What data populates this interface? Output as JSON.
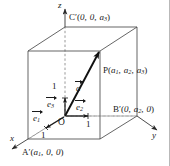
{
  "figure": {
    "kind": "3d-coordinate-box-vector-diagram",
    "width": 170,
    "height": 166,
    "background_color": "#ffffff",
    "line_color": "#4a4a4a",
    "bold_line_color": "#111111",
    "text_color": "#1a1a1a",
    "border_color": "#b9b9b9"
  },
  "axes": {
    "x": {
      "label": "x"
    },
    "y": {
      "label": "y"
    },
    "z": {
      "label": "z"
    }
  },
  "origin": {
    "label": "O"
  },
  "points": {
    "P": {
      "name": "P",
      "prime": "",
      "coords": "(a1, a2, a3)",
      "c1": "a",
      "c1sub": "1",
      "c2": "a",
      "c2sub": "2",
      "c3": "a",
      "c3sub": "3"
    },
    "Ap": {
      "name": "A",
      "prime": "′",
      "coords": "(a1, 0, 0)",
      "c1": "a",
      "c1sub": "1",
      "c2": "0",
      "c3": "0"
    },
    "Bp": {
      "name": "B",
      "prime": "′",
      "coords": "(0, a2, 0)",
      "c1": "0",
      "c2": "a",
      "c2sub": "2",
      "c3": "0"
    },
    "Cp": {
      "name": "C",
      "prime": "′",
      "coords": "(0, 0, a3)",
      "c1": "0",
      "c2": "0",
      "c3": "a",
      "c3sub": "3"
    }
  },
  "vectors": {
    "a": {
      "label": "a",
      "sub": "",
      "description": "position vector from O to P"
    },
    "e1": {
      "label": "e",
      "sub": "1",
      "description": "unit basis vector along x"
    },
    "e2": {
      "label": "e",
      "sub": "2",
      "description": "unit basis vector along y"
    },
    "e3": {
      "label": "e",
      "sub": "3",
      "description": "unit basis vector along z"
    }
  },
  "unit_marks": {
    "x": "1",
    "y": "1",
    "z": "1"
  }
}
